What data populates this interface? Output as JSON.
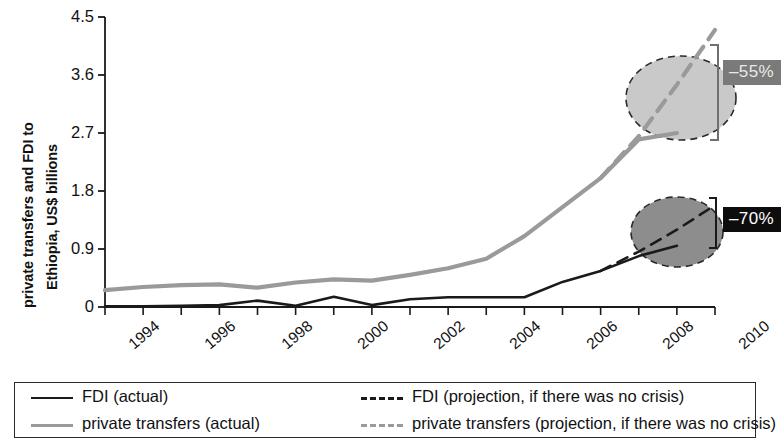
{
  "figure": {
    "ylabel_line1": "private transfers and FDI to",
    "ylabel_line2": "Ethiopia, US$ billions"
  },
  "annotations": [
    {
      "name": "private-transfers-gap",
      "text": "–55%",
      "style": "gray"
    },
    {
      "name": "fdi-gap",
      "text": "–70%",
      "style": "black"
    }
  ],
  "legend": {
    "items": [
      {
        "label": "FDI (actual)",
        "swatch": "sw-solid-black"
      },
      {
        "label": "FDI (projection, if there was no crisis)",
        "swatch": "sw-dash-black"
      },
      {
        "label": "private transfers (actual)",
        "swatch": "sw-solid-gray"
      },
      {
        "label": "private transfers (projection, if there was no crisis)",
        "swatch": "sw-dash-gray"
      }
    ]
  },
  "chart_data": {
    "type": "line",
    "title": "",
    "xlabel": "",
    "ylabel": "private transfers and FDI to Ethiopia, US$ billions",
    "xlim": [
      1994,
      2010
    ],
    "ylim": [
      0,
      4.5
    ],
    "yticks": [
      0,
      0.9,
      1.8,
      2.7,
      3.6,
      4.5
    ],
    "ytick_labels": [
      "0",
      "0.9",
      "1.8",
      "2.7",
      "3.6",
      "4.5"
    ],
    "xticks": [
      1994,
      1995,
      1996,
      1997,
      1998,
      1999,
      2000,
      2001,
      2002,
      2003,
      2004,
      2005,
      2006,
      2007,
      2008,
      2009,
      2010
    ],
    "xtick_labels_shown": [
      "1994",
      "1996",
      "1998",
      "2000",
      "2002",
      "2004",
      "2006",
      "2008",
      "2010"
    ],
    "grid": false,
    "legend_position": "below",
    "colors": {
      "fdi": "#1a1a1a",
      "private_transfers": "#9a9a9a",
      "badge_gray": "#7a7a7a",
      "badge_black": "#0d0d0d"
    },
    "series": [
      {
        "name": "FDI (actual)",
        "style": "solid",
        "color": "#1a1a1a",
        "x": [
          1994,
          1995,
          1996,
          1997,
          1998,
          1999,
          2000,
          2001,
          2002,
          2003,
          2004,
          2005,
          2006,
          2007,
          2008,
          2009
        ],
        "values": [
          0.01,
          0.01,
          0.02,
          0.03,
          0.1,
          0.02,
          0.16,
          0.03,
          0.12,
          0.15,
          0.15,
          0.15,
          0.39,
          0.56,
          0.79,
          0.95
        ]
      },
      {
        "name": "FDI (projection, if there was no crisis)",
        "style": "dashed",
        "color": "#1a1a1a",
        "x": [
          2007,
          2008,
          2009,
          2010
        ],
        "values": [
          0.56,
          0.86,
          1.2,
          1.58
        ]
      },
      {
        "name": "private transfers (actual)",
        "style": "solid",
        "color": "#9a9a9a",
        "x": [
          1994,
          1995,
          1996,
          1997,
          1998,
          1999,
          2000,
          2001,
          2002,
          2003,
          2004,
          2005,
          2006,
          2007,
          2008,
          2009
        ],
        "values": [
          0.26,
          0.31,
          0.34,
          0.35,
          0.3,
          0.38,
          0.43,
          0.41,
          0.5,
          0.6,
          0.75,
          1.1,
          1.55,
          2.0,
          2.6,
          2.7
        ]
      },
      {
        "name": "private transfers (projection, if there was no crisis)",
        "style": "dashed",
        "color": "#9a9a9a",
        "x": [
          2007,
          2008,
          2009,
          2010
        ],
        "values": [
          2.0,
          2.65,
          3.45,
          4.3
        ]
      }
    ],
    "highlights": [
      {
        "name": "private-transfers-gap",
        "label": "–55%",
        "year": 2010,
        "fill": "#c8c8c8"
      },
      {
        "name": "fdi-gap",
        "label": "–70%",
        "year": 2010,
        "fill": "#8c8c8c"
      }
    ]
  }
}
